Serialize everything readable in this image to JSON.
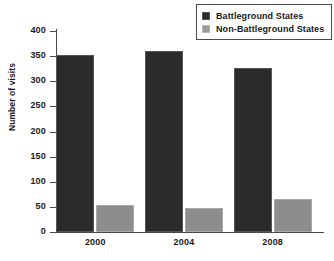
{
  "chart_data": {
    "type": "bar",
    "title": "",
    "xlabel": "",
    "ylabel": "Number of visits",
    "categories": [
      "2000",
      "2004",
      "2008"
    ],
    "series": [
      {
        "name": "Battleground States",
        "color": "#2b2b2b",
        "values": [
          353,
          361,
          327
        ]
      },
      {
        "name": "Non-Battleground States",
        "color": "#8c8c8c",
        "values": [
          54,
          48,
          65
        ]
      }
    ],
    "ylim": [
      0,
      400
    ],
    "ytick_values": [
      400,
      350,
      300,
      250,
      200,
      150,
      100,
      50,
      0
    ],
    "ytick_labels": [
      "400",
      "350",
      "300",
      "250",
      "200",
      "150",
      "100",
      "50",
      "0"
    ],
    "grid": false,
    "legend_position": "top-right"
  },
  "legend": {
    "items": [
      {
        "label": "Battleground States",
        "swatch": "black-square-swatch"
      },
      {
        "label": "Non-Battleground States",
        "swatch": "gray-square-swatch"
      }
    ]
  }
}
